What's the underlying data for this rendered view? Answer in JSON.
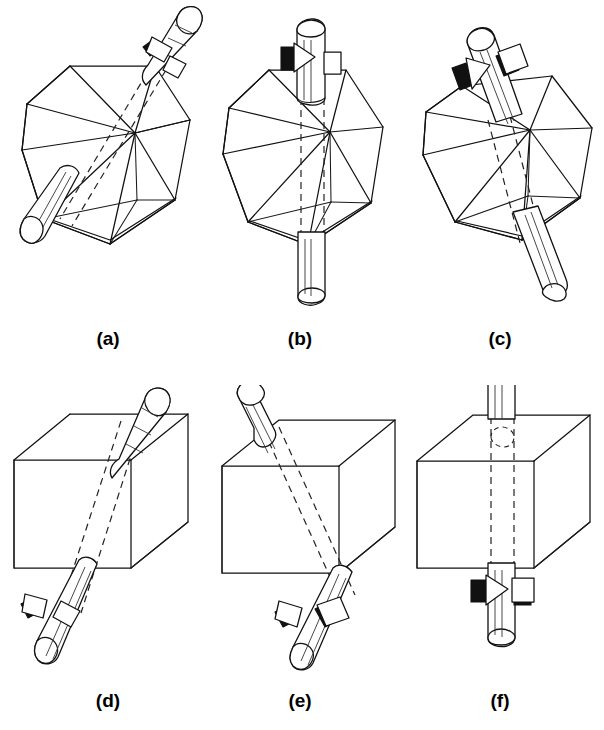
{
  "figure": {
    "background_color": "#ffffff",
    "stroke_color": "#111111",
    "width": 604,
    "height": 730,
    "rows": 2,
    "columns": 3
  },
  "panels": [
    {
      "id": "a",
      "caption": "(a)",
      "solid": "icosahedron",
      "axis_type": "5-fold vertex axis",
      "axis_orientation": "tilted",
      "rotation_arrow": true,
      "hidden_axis_line_style": "dashed"
    },
    {
      "id": "b",
      "caption": "(b)",
      "solid": "icosahedron",
      "axis_type": "5-fold vertex axis",
      "axis_orientation": "vertical",
      "rotation_arrow": true,
      "hidden_axis_line_style": "dashed"
    },
    {
      "id": "c",
      "caption": "(c)",
      "solid": "icosahedron",
      "axis_type": "3-fold face axis",
      "axis_orientation": "tilted",
      "rotation_arrow": true,
      "hidden_axis_line_style": "dashed"
    },
    {
      "id": "d",
      "caption": "(d)",
      "solid": "cube",
      "axis_type": "3-fold body diagonal axis",
      "axis_orientation": "tilted",
      "rotation_arrow": true,
      "hidden_axis_line_style": "dashed"
    },
    {
      "id": "e",
      "caption": "(e)",
      "solid": "cube",
      "axis_type": "2-fold edge axis",
      "axis_orientation": "tilted",
      "rotation_arrow": true,
      "hidden_axis_line_style": "dashed"
    },
    {
      "id": "f",
      "caption": "(f)",
      "solid": "cube",
      "axis_type": "4-fold face axis",
      "axis_orientation": "vertical",
      "rotation_arrow": true,
      "hidden_axis_line_style": "dashed"
    }
  ],
  "captions": {
    "a": "(a)",
    "b": "(b)",
    "c": "(c)",
    "d": "(d)",
    "e": "(e)",
    "f": "(f)"
  }
}
